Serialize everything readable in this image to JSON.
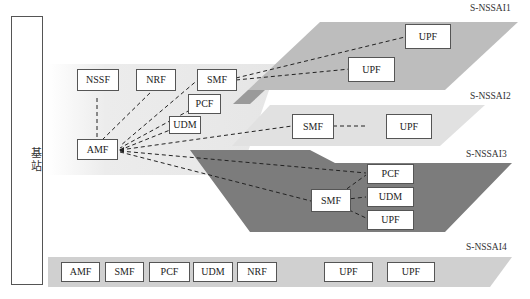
{
  "base_station": {
    "label": "基站"
  },
  "colors": {
    "slice1": "#bdbdbd",
    "slice2": "#e3e3e3",
    "slice3": "#7a7a7a",
    "slice4": "#cfcfcf",
    "shared": "#ededed",
    "border": "#555555"
  },
  "slices": [
    {
      "id": "S-NSSAI1",
      "label": "S-NSSAI1",
      "nfs": [
        "UPF",
        "UPF"
      ]
    },
    {
      "id": "S-NSSAI2",
      "label": "S-NSSAI2",
      "nfs": [
        "SMF",
        "UPF"
      ]
    },
    {
      "id": "S-NSSAI3",
      "label": "S-NSSAI3",
      "nfs": [
        "SMF",
        "PCF",
        "UDM",
        "UPF"
      ]
    },
    {
      "id": "S-NSSAI4",
      "label": "S-NSSAI4",
      "nfs": [
        "AMF",
        "SMF",
        "PCF",
        "UDM",
        "NRF",
        "UPF",
        "UPF"
      ]
    }
  ],
  "shared_nfs": {
    "nssf": "NSSF",
    "nrf": "NRF",
    "smf": "SMF",
    "pcf": "PCF",
    "udm": "UDM",
    "amf": "AMF"
  },
  "connections": [
    [
      "AMF",
      "NSSF"
    ],
    [
      "AMF",
      "NRF"
    ],
    [
      "AMF",
      "SMF(shared)"
    ],
    [
      "AMF",
      "PCF(shared)"
    ],
    [
      "AMF",
      "UDM(shared)"
    ],
    [
      "SMF(shared)",
      "UPF(S-NSSAI1 top)"
    ],
    [
      "SMF(shared)",
      "UPF(S-NSSAI1 bottom)"
    ],
    [
      "AMF",
      "SMF(S-NSSAI2)"
    ],
    [
      "SMF(S-NSSAI2)",
      "UPF(S-NSSAI2)"
    ],
    [
      "AMF",
      "PCF(S-NSSAI3)"
    ],
    [
      "AMF",
      "SMF(S-NSSAI3)"
    ],
    [
      "SMF(S-NSSAI3)",
      "PCF(S-NSSAI3)"
    ],
    [
      "SMF(S-NSSAI3)",
      "UDM(S-NSSAI3)"
    ],
    [
      "SMF(S-NSSAI3)",
      "UPF(S-NSSAI3)"
    ]
  ]
}
